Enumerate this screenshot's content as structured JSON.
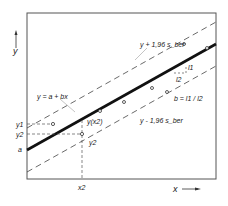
{
  "diagram": {
    "axes": {
      "x_label": "x",
      "y_label": "y"
    },
    "lines": {
      "regression": "y = a + bx",
      "upper_band": "y + 1,96 s_ber",
      "lower_band": "y - 1,96 s_ber"
    },
    "slope": {
      "l1": "l1",
      "l2": "l2",
      "formula": "b = l1 / l2"
    },
    "point_labels": {
      "y1": "y1",
      "y2_axis": "y2",
      "a": "a",
      "y_x2": "y(x2)",
      "y2_point": "y2",
      "x2": "x2"
    }
  }
}
